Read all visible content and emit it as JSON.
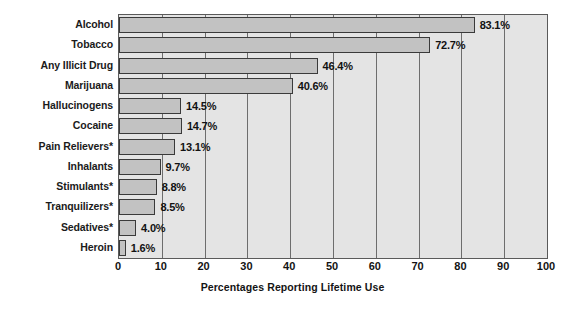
{
  "chart_data": {
    "type": "bar",
    "orientation": "horizontal",
    "title": "",
    "xlabel": "Percentages Reporting Lifetime Use",
    "ylabel": "",
    "xlim": [
      0,
      100
    ],
    "xticks": [
      0,
      10,
      20,
      30,
      40,
      50,
      60,
      70,
      80,
      90,
      100
    ],
    "xtick_labels": [
      "0",
      "10",
      "20",
      "30",
      "40",
      "50",
      "60",
      "70",
      "80",
      "90",
      "100"
    ],
    "grid": true,
    "grid_axis": "x",
    "legend": false,
    "categories": [
      "Alcohol",
      "Tobacco",
      "Any Illicit Drug",
      "Marijuana",
      "Hallucinogens",
      "Cocaine",
      "Pain Relievers*",
      "Inhalants",
      "Stimulants*",
      "Tranquilizers*",
      "Sedatives*",
      "Heroin"
    ],
    "values": [
      83.1,
      72.7,
      46.4,
      40.6,
      14.5,
      14.7,
      13.1,
      9.7,
      8.8,
      8.5,
      4.0,
      1.6
    ],
    "value_labels": [
      "83.1%",
      "72.7%",
      "46.4%",
      "40.6%",
      "14.5%",
      "14.7%",
      "13.1%",
      "9.7%",
      "8.8%",
      "8.5%",
      "4.0%",
      "1.6%"
    ],
    "colors": {
      "bar_fill": "#c2c2c2",
      "bar_border": "#3a3a3a",
      "plot_background": "#e4e4e4",
      "gridline": "#6d6d6d",
      "axis": "#5a5a5a",
      "text": "#131313",
      "page_background": "#ffffff"
    }
  }
}
